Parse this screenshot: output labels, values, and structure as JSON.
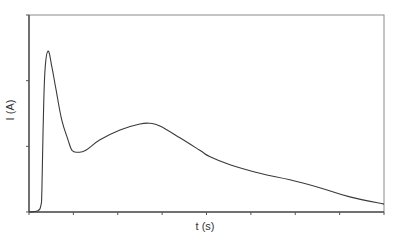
{
  "chart_data": {
    "type": "line",
    "title": "",
    "xlabel": "t (s)",
    "ylabel": "I (A)",
    "x_tick_count": 9,
    "y_tick_count": 4,
    "x_tick_labels": [],
    "y_tick_labels": [],
    "xlim": [
      0,
      8
    ],
    "ylim": [
      0,
      3
    ],
    "units_note": "axes unlabeled numerically; values in tick-division units",
    "grid": false,
    "legend": null,
    "series": [
      {
        "name": "I(t)",
        "color": "#3a3a3a",
        "x": [
          0,
          0.2,
          0.27,
          0.29,
          0.32,
          0.36,
          0.43,
          0.52,
          0.61,
          0.74,
          0.88,
          0.97,
          1.1,
          1.28,
          1.6,
          2.05,
          2.5,
          2.73,
          2.95,
          3.4,
          3.85,
          4.08,
          4.53,
          5.2,
          5.88,
          6.55,
          7.23,
          8.0
        ],
        "y": [
          0,
          0.02,
          0.11,
          0.33,
          1.32,
          2.16,
          2.45,
          2.19,
          1.86,
          1.4,
          1.1,
          0.94,
          0.91,
          0.94,
          1.1,
          1.25,
          1.34,
          1.35,
          1.31,
          1.13,
          0.94,
          0.84,
          0.72,
          0.59,
          0.49,
          0.37,
          0.23,
          0.12
        ]
      }
    ]
  },
  "colors": {
    "axis": "#555555",
    "frame": "#888888",
    "line": "#3a3a3a",
    "text": "#333333",
    "background": "#ffffff"
  }
}
